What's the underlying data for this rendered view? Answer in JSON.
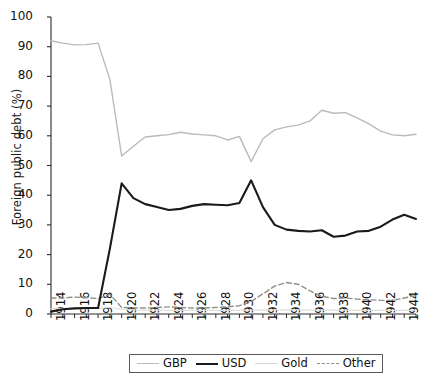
{
  "chart_data": {
    "type": "line",
    "title": "",
    "xlabel": "",
    "ylabel": "Foreign public debt (%)",
    "xlim": [
      1914,
      1945
    ],
    "ylim": [
      0,
      100
    ],
    "grid": false,
    "legend_position": "bottom-center",
    "y_ticks": [
      0,
      10,
      20,
      30,
      40,
      50,
      60,
      70,
      80,
      90,
      100
    ],
    "y_tick_labels": [
      "0",
      "10",
      "20",
      "30",
      "40",
      "50",
      "60",
      "70",
      "80",
      "90",
      "100"
    ],
    "x_ticks": [
      1914,
      1915,
      1916,
      1917,
      1918,
      1919,
      1920,
      1921,
      1922,
      1923,
      1924,
      1925,
      1926,
      1927,
      1928,
      1929,
      1930,
      1931,
      1932,
      1933,
      1934,
      1935,
      1936,
      1937,
      1938,
      1939,
      1940,
      1941,
      1942,
      1943,
      1944,
      1945
    ],
    "x_tick_labels": [
      "1914",
      "1916",
      "1918",
      "1920",
      "1922",
      "1924",
      "1926",
      "1928",
      "1930",
      "1932",
      "1934",
      "1936",
      "1938",
      "1940",
      "1942",
      "1944"
    ],
    "x_tick_label_years": [
      1914,
      1916,
      1918,
      1920,
      1922,
      1924,
      1926,
      1928,
      1930,
      1932,
      1934,
      1936,
      1938,
      1940,
      1942,
      1944
    ],
    "x": [
      1914,
      1915,
      1916,
      1917,
      1918,
      1919,
      1920,
      1921,
      1922,
      1923,
      1924,
      1925,
      1926,
      1927,
      1928,
      1929,
      1930,
      1931,
      1932,
      1933,
      1934,
      1935,
      1936,
      1937,
      1938,
      1939,
      1940,
      1941,
      1942,
      1943,
      1944,
      1945
    ],
    "series": [
      {
        "name": "GBP",
        "color": "#b9bcb4",
        "style": "solid",
        "width": 1.4,
        "values": [
          92.0,
          91.2,
          90.6,
          90.7,
          91.2,
          79.0,
          53.2,
          56.5,
          59.6,
          60.0,
          60.4,
          61.2,
          60.6,
          60.3,
          60.0,
          58.6,
          59.8,
          51.3,
          59.0,
          62.0,
          63.0,
          63.6,
          65.0,
          68.6,
          67.6,
          67.8,
          66.0,
          64.0,
          61.6,
          60.3,
          60.0,
          60.5
        ]
      },
      {
        "name": "USD",
        "color": "#1a1a1a",
        "style": "solid",
        "width": 2.1,
        "values": [
          0.8,
          1.6,
          1.9,
          2.0,
          2.0,
          22.0,
          44.0,
          39.0,
          37.0,
          36.0,
          35.0,
          35.4,
          36.4,
          37.0,
          36.8,
          36.6,
          37.4,
          45.0,
          36.0,
          30.0,
          28.4,
          28.0,
          27.8,
          28.2,
          26.0,
          26.4,
          27.8,
          28.0,
          29.4,
          31.8,
          33.4,
          32.0
        ]
      },
      {
        "name": "Gold",
        "color": "#dedfd8",
        "style": "solid",
        "width": 1.2,
        "values": [
          1.8,
          1.8,
          1.8,
          1.8,
          1.9,
          2.2,
          1.6,
          1.4,
          1.3,
          1.3,
          1.2,
          1.2,
          1.2,
          1.2,
          1.2,
          1.2,
          1.2,
          1.3,
          1.3,
          1.4,
          1.4,
          1.4,
          1.3,
          1.3,
          1.3,
          1.3,
          1.2,
          1.2,
          1.2,
          1.2,
          1.2,
          1.2
        ]
      },
      {
        "name": "Other",
        "color": "#8e9189",
        "style": "dashed",
        "width": 1.4,
        "values": [
          5.4,
          5.4,
          5.7,
          5.5,
          5.2,
          6.6,
          2.2,
          2.1,
          2.0,
          2.2,
          2.4,
          2.2,
          2.0,
          2.0,
          2.2,
          2.4,
          2.8,
          4.2,
          6.8,
          9.4,
          10.6,
          10.0,
          7.8,
          6.0,
          5.2,
          5.4,
          5.0,
          4.8,
          4.6,
          4.6,
          5.4,
          6.2
        ]
      }
    ],
    "legend": [
      {
        "label": "GBP",
        "color": "#b9bcb4",
        "style": "solid",
        "width": 1.4
      },
      {
        "label": "USD",
        "color": "#1a1a1a",
        "style": "solid",
        "width": 2.4
      },
      {
        "label": "Gold",
        "color": "#d6d8d0",
        "style": "solid",
        "width": 1.2
      },
      {
        "label": "Other",
        "color": "#8e9189",
        "style": "dashed",
        "width": 1.4
      }
    ]
  }
}
